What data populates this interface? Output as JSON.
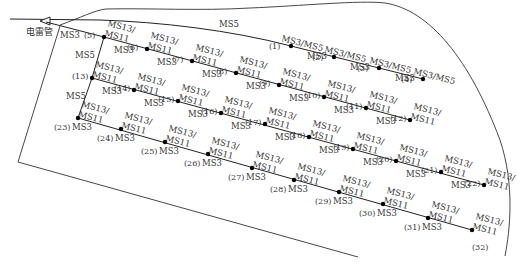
{
  "detonator_label": "电雷管",
  "colors": {
    "line": "#222222",
    "text": "#333333",
    "hole": "#000000",
    "background": "#ffffff"
  },
  "trunk_labels": {
    "top_ms5": "MS5",
    "start_ms3": "MS3",
    "left_ms5_upper": "MS5",
    "left_ms5_lower": "MS5"
  },
  "holes": [
    {
      "id": "(1)",
      "x": 291,
      "y": 46,
      "delay": "MS3/MS5",
      "link": "MS3"
    },
    {
      "id": "(2)",
      "x": 334,
      "y": 57,
      "delay": "MS3/MS5",
      "link": "MS3"
    },
    {
      "id": "(3)",
      "x": 379,
      "y": 68,
      "delay": "MS3/MS5",
      "link": "MS3"
    },
    {
      "id": "(4)",
      "x": 423,
      "y": 79,
      "delay": "MS3/MS5",
      "link": ""
    },
    {
      "id": "(5)",
      "x": 104,
      "y": 37,
      "delay": "MS13/MS11",
      "link": "MS3"
    },
    {
      "id": "(6)",
      "x": 147,
      "y": 49,
      "delay": "MS13/MS11",
      "link": "MS3"
    },
    {
      "id": "(7)",
      "x": 192,
      "y": 61,
      "delay": "MS13/MS11",
      "link": "MS3"
    },
    {
      "id": "(8)",
      "x": 236,
      "y": 73,
      "delay": "MS13/MS11",
      "link": "MS3"
    },
    {
      "id": "(9)",
      "x": 279,
      "y": 85,
      "delay": "MS13/MS11",
      "link": "MS3"
    },
    {
      "id": "(10)",
      "x": 324,
      "y": 97,
      "delay": "MS13/MS11",
      "link": "MS3"
    },
    {
      "id": "(11)",
      "x": 366,
      "y": 108,
      "delay": "MS13/MS11",
      "link": "MS3"
    },
    {
      "id": "(12)",
      "x": 410,
      "y": 120,
      "delay": "MS13/MS11",
      "link": ""
    },
    {
      "id": "(13)",
      "x": 92,
      "y": 78,
      "delay": "MS13/MS11",
      "link": "MS3"
    },
    {
      "id": "(14)",
      "x": 134,
      "y": 90,
      "delay": "MS13/MS11",
      "link": "MS3"
    },
    {
      "id": "(15)",
      "x": 178,
      "y": 101,
      "delay": "MS13/MS11",
      "link": "MS3"
    },
    {
      "id": "(16)",
      "x": 221,
      "y": 113,
      "delay": "MS13/MS11",
      "link": "MS3"
    },
    {
      "id": "(17)",
      "x": 265,
      "y": 124,
      "delay": "MS13/MS11",
      "link": "MS3"
    },
    {
      "id": "(18)",
      "x": 309,
      "y": 137,
      "delay": "MS13/MS11",
      "link": "MS3"
    },
    {
      "id": "(19)",
      "x": 353,
      "y": 149,
      "delay": "MS13/MS11",
      "link": "MS3"
    },
    {
      "id": "(20)",
      "x": 396,
      "y": 161,
      "delay": "MS13/MS11",
      "link": "MS3"
    },
    {
      "id": "(21)",
      "x": 441,
      "y": 172,
      "delay": "MS13/MS11",
      "link": "MS3"
    },
    {
      "id": "(22)",
      "x": 484,
      "y": 185,
      "delay": "MS13/MS11",
      "link": ""
    },
    {
      "id": "(23)",
      "x": 78,
      "y": 118,
      "delay": "MS13/MS11",
      "link": "MS3"
    },
    {
      "id": "(24)",
      "x": 121,
      "y": 129,
      "delay": "MS13/MS11",
      "link": "MS3"
    },
    {
      "id": "(25)",
      "x": 165,
      "y": 142,
      "delay": "MS13/MS11",
      "link": "MS3"
    },
    {
      "id": "(26)",
      "x": 208,
      "y": 154,
      "delay": "MS13/MS11",
      "link": "MS3"
    },
    {
      "id": "(27)",
      "x": 252,
      "y": 168,
      "delay": "MS13/MS11",
      "link": "MS3"
    },
    {
      "id": "(28)",
      "x": 294,
      "y": 180,
      "delay": "MS13/MS11",
      "link": "MS3"
    },
    {
      "id": "(29)",
      "x": 339,
      "y": 192,
      "delay": "MS13/MS11",
      "link": "MS3"
    },
    {
      "id": "(30)",
      "x": 383,
      "y": 204,
      "delay": "MS13/MS11",
      "link": "MS3"
    },
    {
      "id": "(31)",
      "x": 428,
      "y": 218,
      "delay": "MS13/MS11",
      "link": "MS3"
    },
    {
      "id": "(32)",
      "x": 472,
      "y": 230,
      "delay": "MS13/MS11",
      "link": ""
    }
  ]
}
